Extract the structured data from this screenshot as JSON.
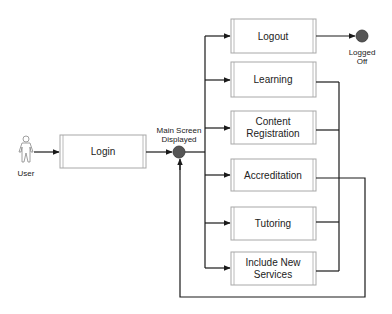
{
  "diagram": {
    "type": "activity-flow",
    "colors": {
      "line": "#1a1a1a",
      "box_border": "#a8a8a8",
      "node_fill": "#555555",
      "text": "#222222"
    },
    "actor": {
      "label": "User"
    },
    "login": {
      "label": "Login"
    },
    "hub": {
      "line1": "Main Screen",
      "line2": "Displayed"
    },
    "end": {
      "line1": "Logged",
      "line2": "Off"
    },
    "options": [
      {
        "id": "logout",
        "line1": "Logout",
        "line2": ""
      },
      {
        "id": "learning",
        "line1": "Learning",
        "line2": ""
      },
      {
        "id": "content-registration",
        "line1": "Content",
        "line2": "Registration"
      },
      {
        "id": "accreditation",
        "line1": "Accreditation",
        "line2": ""
      },
      {
        "id": "tutoring",
        "line1": "Tutoring",
        "line2": ""
      },
      {
        "id": "include-new-services",
        "line1": "Include New",
        "line2": "Services"
      }
    ]
  }
}
